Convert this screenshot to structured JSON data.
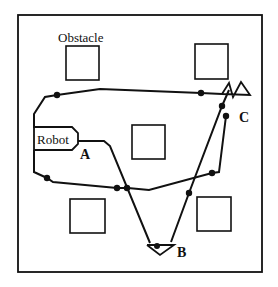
{
  "diagram": {
    "type": "robot-navigation-map",
    "labels": {
      "obstacle": "Obstacle",
      "robot": "Robot",
      "point_a": "A",
      "point_b": "B",
      "point_c": "C"
    },
    "colors": {
      "stroke": "#111111",
      "background": "#ffffff"
    },
    "obstacles": [
      {
        "id": "top-left",
        "x": 66,
        "y": 46,
        "w": 33,
        "h": 34
      },
      {
        "id": "top-right",
        "x": 195,
        "y": 44,
        "w": 33,
        "h": 35
      },
      {
        "id": "center",
        "x": 132,
        "y": 125,
        "w": 33,
        "h": 34
      },
      {
        "id": "bottom-left",
        "x": 70,
        "y": 199,
        "w": 35,
        "h": 34
      },
      {
        "id": "bottom-right",
        "x": 197,
        "y": 197,
        "w": 34,
        "h": 34
      }
    ],
    "waypoints": [
      {
        "x": 57,
        "y": 95
      },
      {
        "x": 201,
        "y": 93
      },
      {
        "x": 222,
        "y": 106
      },
      {
        "x": 226,
        "y": 116
      },
      {
        "x": 47,
        "y": 178
      },
      {
        "x": 117,
        "y": 188
      },
      {
        "x": 127,
        "y": 188
      },
      {
        "x": 189,
        "y": 193
      },
      {
        "x": 212,
        "y": 173
      },
      {
        "x": 157,
        "y": 246
      }
    ]
  }
}
